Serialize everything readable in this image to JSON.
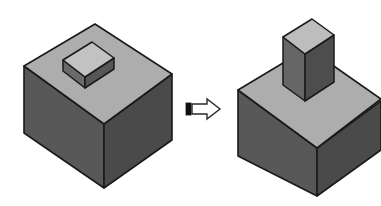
{
  "page": {
    "width": 381,
    "height": 206,
    "background_color": "#ffffff",
    "kind": "technical-illustration"
  },
  "clipped_header": {
    "visible_fragment": "",
    "note": "bottom sliver of a cut-off line of text along the very top edge; glyphs are not legible"
  },
  "colors": {
    "outline": "#1a1a1a",
    "top_face": "#adadad",
    "front_face": "#585858",
    "side_face": "#4a4a4a",
    "boss_top_face": "#c2c2c2",
    "boss_front_face": "#6a6a6a",
    "boss_side_face": "#565656",
    "column_top_face": "#bdbdbd",
    "column_front_face": "#666666",
    "column_side_face": "#4d4d4d",
    "arrow_fill": "#ffffff",
    "arrow_outline": "#2a2a2a",
    "arrow_tail_fill": "#111111",
    "background": "#ffffff"
  },
  "figures": [
    {
      "id": "before",
      "data_name": "before-solid",
      "label": "",
      "shape": "cube-with-square-boss",
      "parts": [
        "cube-body",
        "square-boss"
      ],
      "faces": {
        "cube_top": "M 24,66 L 95,24 L 172,74 L 104,124 Z",
        "cube_front": "M 24,66 L 104,124 L 104,188 L 24,133 Z",
        "cube_side": "M 104,124 L 172,74 L 172,140 L 104,188 Z",
        "boss_top": "M 63,60 L 92,43 L 114,58 L 85,77 Z",
        "boss_front": "M 63,60 L 85,77 L 85,87 L 63,70 Z",
        "boss_side": "M 85,77 L 114,58 L 114,68 L 85,87 Z"
      }
    },
    {
      "id": "after",
      "data_name": "after-solid",
      "label": "",
      "shape": "cube-with-extruded-column",
      "parts": [
        "cube-body",
        "extruded-column"
      ],
      "faces": {
        "cube_top": "M 238,90 L 308,48 L 385,98 L 317,148 Z",
        "cube_front": "M 238,90 L 317,148 L 317,196 L 238,156 Z",
        "cube_side": "M 317,148 L 385,98 L 385,148 L 317,196 Z",
        "column_top": "M 283,37 L 312,20 L 334,35 L 305,54 Z",
        "column_front": "M 283,37 L 305,54 L 305,101 L 283,85 Z",
        "column_side": "M 305,54 L 334,35 L 334,82 L 305,101 Z"
      }
    }
  ],
  "arrow": {
    "data_name": "transformation-arrow",
    "direction": "right",
    "style": "outlined-block-arrow-with-filled-tail",
    "bbox": {
      "x": 186,
      "y": 98,
      "width": 34,
      "height": 21
    },
    "body_path": "M 192,104 L 207,104 L 207,99 L 220,109 L 207,119 L 207,114 L 192,114 Z",
    "tail_rect": {
      "x": 186,
      "y": 103,
      "width": 5,
      "height": 12
    }
  }
}
